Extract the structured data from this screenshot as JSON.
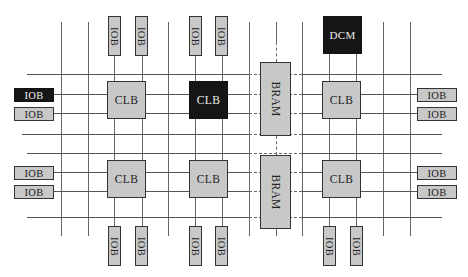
{
  "diagram": {
    "type": "FPGA architecture block diagram",
    "colors": {
      "block_fill": "#c8c8c8",
      "highlight_fill": "#161616",
      "line": "#555555"
    },
    "labels": {
      "iob": "IOB",
      "clb": "CLB",
      "bram": "BRAM",
      "dcm": "DCM"
    },
    "top_iobs": [
      {
        "label": "IOB",
        "x": 108
      },
      {
        "label": "IOB",
        "x": 136
      },
      {
        "label": "IOB",
        "x": 189
      },
      {
        "label": "IOB",
        "x": 215
      }
    ],
    "bottom_iobs": [
      {
        "label": "IOB",
        "x": 108
      },
      {
        "label": "IOB",
        "x": 135
      },
      {
        "label": "IOB",
        "x": 189
      },
      {
        "label": "IOB",
        "x": 215
      },
      {
        "label": "IOB",
        "x": 323
      },
      {
        "label": "IOB",
        "x": 350
      }
    ],
    "left_iobs": [
      {
        "label": "IOB",
        "y": 88,
        "highlighted": true
      },
      {
        "label": "IOB",
        "y": 107,
        "highlighted": false
      },
      {
        "label": "IOB",
        "y": 166,
        "highlighted": false
      },
      {
        "label": "IOB",
        "y": 185,
        "highlighted": false
      }
    ],
    "right_iobs": [
      {
        "label": "IOB",
        "y": 88
      },
      {
        "label": "IOB",
        "y": 107
      },
      {
        "label": "IOB",
        "y": 166
      },
      {
        "label": "IOB",
        "y": 185
      }
    ],
    "clbs": [
      {
        "label": "CLB",
        "x": 107,
        "y": 81,
        "highlighted": false
      },
      {
        "label": "CLB",
        "x": 189,
        "y": 81,
        "highlighted": true
      },
      {
        "label": "CLB",
        "x": 322,
        "y": 81,
        "highlighted": false
      },
      {
        "label": "CLB",
        "x": 107,
        "y": 160,
        "highlighted": false
      },
      {
        "label": "CLB",
        "x": 189,
        "y": 160,
        "highlighted": false
      },
      {
        "label": "CLB",
        "x": 322,
        "y": 160,
        "highlighted": false
      }
    ],
    "brams": [
      {
        "label": "BRAM",
        "x": 260,
        "y": 62
      },
      {
        "label": "BRAM",
        "x": 260,
        "y": 155
      }
    ],
    "dcm": {
      "label": "DCM",
      "x": 323,
      "y": 16
    }
  }
}
